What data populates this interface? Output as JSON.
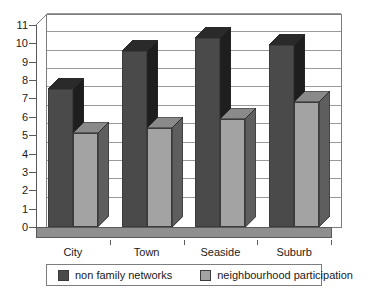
{
  "chart_data": {
    "type": "bar",
    "title": "",
    "subtitle": "",
    "xlabel": "",
    "ylabel": "",
    "categories": [
      "City",
      "Town",
      "Seaside",
      "Suburb"
    ],
    "series": [
      {
        "name": "non family networks",
        "values": [
          7.5,
          9.6,
          10.3,
          9.9
        ],
        "color": "#4a4a4a"
      },
      {
        "name": "neighbourhood participation",
        "values": [
          5.1,
          5.4,
          5.9,
          6.8
        ],
        "color": "#a3a3a3"
      }
    ],
    "ylim": [
      0,
      11
    ],
    "yticks": [
      0,
      1,
      2,
      3,
      4,
      5,
      6,
      7,
      8,
      9,
      10,
      11
    ],
    "ytick_labels": [
      "0",
      "1",
      "2",
      "3",
      "4",
      "5",
      "6",
      "7",
      "8",
      "9",
      "10",
      "11"
    ],
    "grid": true,
    "grid_axis": "y",
    "legend_position": "bottom",
    "style": "3d-column",
    "colors": {
      "series_dark": "#4a4a4a",
      "series_light": "#a3a3a3",
      "series_dark_side": "#1e1e1e",
      "series_light_side": "#5e5e5e",
      "series_dark_top": "#2a2a2a",
      "series_light_top": "#8a8a8a",
      "gridline": "#9a9a9a",
      "axis": "#5a5a5a",
      "plot_border": "#7d7d7d",
      "floor": "#8f8f8f",
      "background": "#ffffff",
      "text": "#1a1a1a"
    }
  },
  "legend": {
    "entries": [
      {
        "label": "non family networks"
      },
      {
        "label": "neighbourhood participation"
      }
    ]
  }
}
